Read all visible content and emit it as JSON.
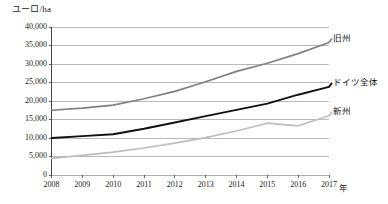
{
  "chart_data": {
    "type": "line",
    "title": "",
    "subtitle": "",
    "xlabel": "年",
    "ylabel": "ユーロ/ha",
    "x": [
      2008,
      2009,
      2010,
      2011,
      2012,
      2013,
      2014,
      2015,
      2016,
      2017
    ],
    "xticklabels": [
      "2008",
      "2009",
      "2010",
      "2011",
      "2012",
      "2013",
      "2014",
      "2015",
      "2016",
      "2017"
    ],
    "yticklabels": [
      "0",
      "5,000",
      "10,000",
      "15,000",
      "20,000",
      "25,000",
      "30,000",
      "35,000",
      "40,000"
    ],
    "ytickvalues": [
      0,
      5000,
      10000,
      15000,
      20000,
      25000,
      30000,
      35000,
      40000
    ],
    "ylim": [
      0,
      40000
    ],
    "xlim": [
      2008,
      2017
    ],
    "grid": "horizontal",
    "legend_position": "right-inline-labels",
    "series": [
      {
        "name": "旧州",
        "color": "#808080",
        "width": 1.7,
        "values": [
          17500,
          18100,
          18900,
          20600,
          22600,
          25200,
          28000,
          30200,
          32800,
          35800
        ]
      },
      {
        "name": "ドイツ全体",
        "color": "#111111",
        "width": 1.9,
        "values": [
          10000,
          10500,
          11000,
          12500,
          14200,
          15900,
          17600,
          19300,
          21700,
          23800
        ]
      },
      {
        "name": "新州",
        "color": "#bdbdbd",
        "width": 1.7,
        "values": [
          4500,
          5300,
          6200,
          7300,
          8600,
          10100,
          11900,
          14000,
          13300,
          16000
        ]
      }
    ]
  },
  "axis": {
    "y_title": "ユーロ/ha",
    "x_title": "年"
  },
  "colors": {
    "gridline": "#9a9a9a",
    "axis": "#444444",
    "text": "#1a1a1a",
    "series_old": "#808080",
    "series_total": "#111111",
    "series_new": "#bdbdbd"
  }
}
